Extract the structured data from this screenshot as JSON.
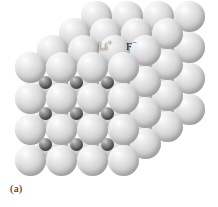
{
  "figure": {
    "caption": "(a)",
    "structure_name": "rock-salt-lattice",
    "background_color": "#ffffff"
  },
  "ions": {
    "cation": {
      "symbol": "Li",
      "charge": "+",
      "label_text": "Li",
      "label_charge": "+",
      "role": "small dark sphere",
      "color": "#757575",
      "label_color": "#f2f2f2",
      "diameter_px": 13
    },
    "anion": {
      "symbol": "F",
      "charge": "−",
      "label_text": "F",
      "label_charge": "−",
      "role": "large light sphere",
      "color": "#d2d2d2",
      "label_color": "#1a1a1a",
      "diameter_px": 31
    }
  },
  "labels": [
    {
      "name": "cation-label",
      "text": "Li",
      "charge": "+",
      "x": 98,
      "y": 41
    },
    {
      "name": "anion-label",
      "text": "F",
      "charge": "−",
      "x": 126,
      "y": 41
    }
  ],
  "lattice": {
    "type": "face-centered-cubic-rock-salt",
    "rows": 4,
    "columns": 4,
    "depth_layers": 4,
    "anion_spacing_px": 31,
    "depth_step_x_px": 22,
    "depth_step_y_px": -17
  }
}
